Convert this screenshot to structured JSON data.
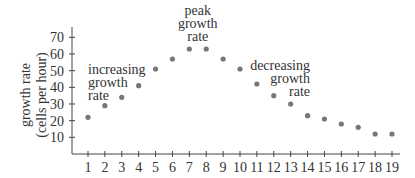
{
  "chart_data": {
    "type": "scatter",
    "title": "",
    "xlabel": "",
    "ylabel": "growth rate (cells per hour)",
    "ylabel_lines": [
      "growth rate",
      "(cells per hour)"
    ],
    "x": [
      1,
      2,
      3,
      4,
      5,
      6,
      7,
      8,
      9,
      10,
      11,
      12,
      13,
      14,
      15,
      16,
      17,
      18,
      19
    ],
    "values": [
      22,
      29,
      34,
      41,
      51,
      57,
      63,
      63,
      57,
      51,
      42,
      35,
      30,
      23,
      21,
      18,
      16,
      12,
      12
    ],
    "xticks": [
      "1",
      "2",
      "3",
      "4",
      "5",
      "6",
      "7",
      "8",
      "9",
      "10",
      "11",
      "12",
      "13",
      "14",
      "15",
      "16",
      "17",
      "18",
      "19"
    ],
    "yticks": [
      "10",
      "20",
      "30",
      "40",
      "50",
      "60",
      "70"
    ],
    "ylim": [
      0,
      75
    ],
    "xlim": [
      0,
      19.5
    ],
    "grid": false,
    "point_color": "#777777",
    "annotations": [
      {
        "lines": [
          "increasing",
          "growth",
          "rate"
        ],
        "align": "left"
      },
      {
        "lines": [
          "peak",
          "growth",
          "rate"
        ],
        "align": "center"
      },
      {
        "lines": [
          "decreasing",
          "growth",
          "rate"
        ],
        "align": "right"
      }
    ]
  }
}
